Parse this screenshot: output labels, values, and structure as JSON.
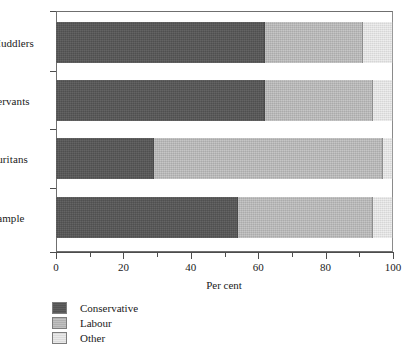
{
  "chart_data": {
    "type": "bar",
    "orientation": "horizontal",
    "stacked": true,
    "title": "",
    "xlabel": "Per cent",
    "ylabel": "",
    "xlim": [
      0,
      100
    ],
    "grid": false,
    "legend_position": "bottom-left",
    "categories": [
      "Muddlers",
      "Servants",
      "Puritans",
      "Sample"
    ],
    "tick_labels": [
      "0",
      "20",
      "40",
      "60",
      "80",
      "100"
    ],
    "tick_values": [
      0,
      20,
      40,
      60,
      80,
      100
    ],
    "minor_tick_values": [
      10,
      30,
      50,
      70,
      90
    ],
    "series": [
      {
        "name": "Conservative",
        "color": "#575757",
        "values": [
          62,
          62,
          29,
          54
        ]
      },
      {
        "name": "Labour",
        "color": "#b9b9b9",
        "values": [
          29,
          32,
          68,
          40
        ]
      },
      {
        "name": "Other",
        "color": "#e2e2e2",
        "values": [
          9,
          6,
          3,
          6
        ]
      }
    ]
  },
  "legend": {
    "items": [
      {
        "label": "Conservative"
      },
      {
        "label": "Labour"
      },
      {
        "label": "Other"
      }
    ]
  },
  "axis": {
    "x_title": "Per cent"
  }
}
